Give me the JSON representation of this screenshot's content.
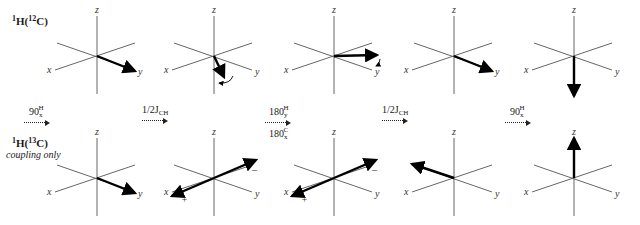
{
  "rows": [
    {
      "label_main": "1",
      "label_iso": "H(",
      "label_mass": "12",
      "label_el": "C)",
      "full_label": "1H(12C)",
      "sublabel": ""
    },
    {
      "label_main": "1",
      "label_iso": "H(",
      "label_mass": "13",
      "label_el": "C)",
      "full_label": "1H(13C)",
      "sublabel": "coupling only"
    }
  ],
  "axis_labels": {
    "x": "x",
    "y": "y",
    "z": "z"
  },
  "sign_labels": {
    "plus": "+",
    "minus": "–"
  },
  "pulses": [
    {
      "base": "90",
      "sup": "H",
      "sub": "x",
      "lower": null
    },
    {
      "base": "1/2J",
      "sub": "CH",
      "sup": "",
      "lower": null
    },
    {
      "base": "180",
      "sup": "H",
      "sub": "y",
      "lower": {
        "base": "180",
        "sup": "C",
        "sub": "x"
      }
    },
    {
      "base": "1/2J",
      "sub": "CH",
      "sup": "",
      "lower": null
    },
    {
      "base": "90",
      "sup": "H",
      "sub": "x",
      "lower": null
    }
  ],
  "diagrams": {
    "top": [
      {
        "vectors": [
          {
            "dir": "down-right-y",
            "dx": 38,
            "dy": 15
          }
        ],
        "curl": null
      },
      {
        "vectors": [
          {
            "dir": "down-into-frame",
            "dx": 10,
            "dy": 21
          }
        ],
        "curl": "rotate-left"
      },
      {
        "vectors": [
          {
            "dir": "toward-y-right",
            "dx": 43,
            "dy": -1
          }
        ],
        "curl": "small-down"
      },
      {
        "vectors": [
          {
            "dir": "down-right-y",
            "dx": 38,
            "dy": 15
          }
        ],
        "curl": null
      },
      {
        "vectors": [
          {
            "dir": "minus-z",
            "dx": 0,
            "dy": 40
          }
        ],
        "curl": null
      }
    ],
    "bottom": [
      {
        "vectors": [
          {
            "dir": "down-right-y",
            "dx": 38,
            "dy": 15
          }
        ],
        "signs": []
      },
      {
        "vectors": [
          {
            "dir": "toward-x",
            "dx": -42,
            "dy": 18
          },
          {
            "dir": "toward-minus-x",
            "dx": 42,
            "dy": -18
          }
        ],
        "signs": [
          "+",
          "–"
        ]
      },
      {
        "vectors": [
          {
            "dir": "toward-x",
            "dx": -42,
            "dy": 18
          },
          {
            "dir": "toward-minus-x",
            "dx": 42,
            "dy": -18
          }
        ],
        "signs": [
          "+",
          "–"
        ]
      },
      {
        "vectors": [
          {
            "dir": "toward-minus-y",
            "dx": -42,
            "dy": -14
          }
        ],
        "signs": []
      },
      {
        "vectors": [
          {
            "dir": "plus-z",
            "dx": 0,
            "dy": -40
          }
        ],
        "signs": []
      }
    ]
  },
  "clipped_caption": "..."
}
